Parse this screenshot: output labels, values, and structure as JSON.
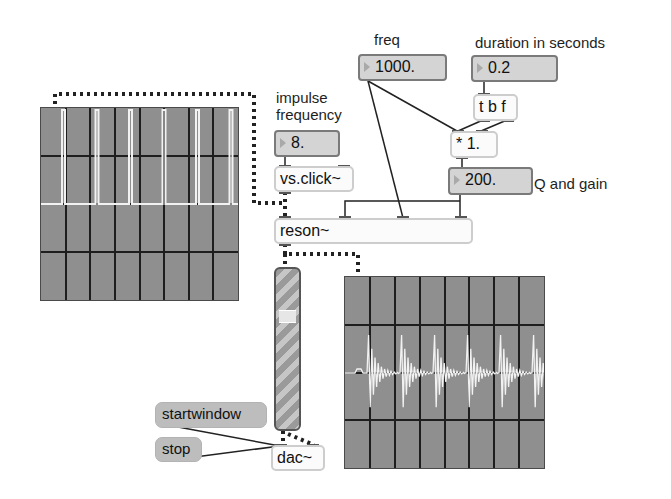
{
  "patch": {
    "labels": {
      "freq": "freq",
      "duration": "duration in seconds",
      "impulse_line1": "impulse",
      "impulse_line2": "frequency",
      "q_and_gain": "Q and gain"
    },
    "number_boxes": {
      "freq": "1000.",
      "duration": "0.2",
      "impulse_freq": "8.",
      "q_gain": "200."
    },
    "objects": {
      "trigger": "t b f",
      "multiply": "* 1.",
      "click": "vs.click~",
      "reson": "reson~",
      "dac": "dac~"
    },
    "messages": {
      "start": "startwindow",
      "stop": "stop"
    },
    "gain_slider": {
      "value_fraction": 0.72
    },
    "scopes": {
      "input": {
        "name": "impulse-scope",
        "signal": "impulse train",
        "spike_count": 6
      },
      "output": {
        "name": "resonator-scope",
        "signal": "resonant bursts",
        "burst_count": 6
      }
    },
    "colors": {
      "scope_bg": "#8f8f8f",
      "scope_trace": "#f2f2f2",
      "number_box_bg": "#d4d4d4",
      "message_box_bg": "#bdbdbd",
      "patch_cord": "#222222"
    }
  }
}
